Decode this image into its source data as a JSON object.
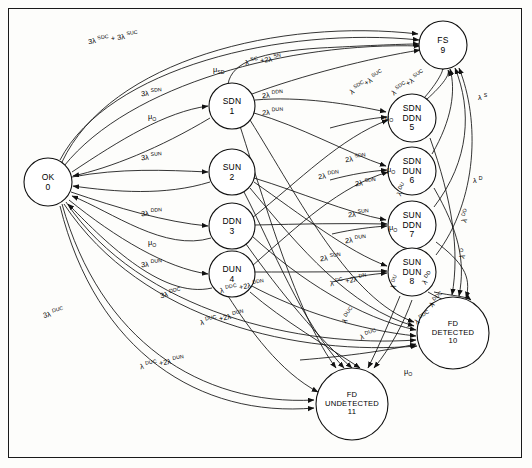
{
  "diagram": {
    "type": "markov-state-transition-diagram",
    "title": "",
    "border": {
      "color": "#1a1a1a"
    },
    "nodes": [
      {
        "id": "0",
        "name": "OK",
        "lines": [
          "OK",
          "0"
        ],
        "cx": 48,
        "cy": 182,
        "r": 24
      },
      {
        "id": "1",
        "name": "SDN",
        "lines": [
          "SDN",
          "1"
        ],
        "cx": 232,
        "cy": 106,
        "r": 23
      },
      {
        "id": "2",
        "name": "SUN",
        "lines": [
          "SUN",
          "2"
        ],
        "cx": 232,
        "cy": 172,
        "r": 23
      },
      {
        "id": "3",
        "name": "DDN",
        "lines": [
          "DDN",
          "3"
        ],
        "cx": 232,
        "cy": 226,
        "r": 23
      },
      {
        "id": "4",
        "name": "DUN",
        "lines": [
          "DUN",
          "4"
        ],
        "cx": 232,
        "cy": 274,
        "r": 23
      },
      {
        "id": "5",
        "name": "SDN DDN",
        "lines": [
          "SDN",
          "DDN",
          "5"
        ],
        "cx": 412,
        "cy": 118,
        "r": 24
      },
      {
        "id": "6",
        "name": "SDN DUN",
        "lines": [
          "SDN",
          "DUN",
          "6"
        ],
        "cx": 412,
        "cy": 171,
        "r": 24
      },
      {
        "id": "7",
        "name": "SUN DDN",
        "lines": [
          "SUN",
          "DDN",
          "7"
        ],
        "cx": 412,
        "cy": 225,
        "r": 24
      },
      {
        "id": "8",
        "name": "SUN DUN",
        "lines": [
          "SUN",
          "DUN",
          "8"
        ],
        "cx": 412,
        "cy": 272,
        "r": 24
      },
      {
        "id": "9",
        "name": "FS",
        "lines": [
          "FS",
          "9"
        ],
        "cx": 443,
        "cy": 45,
        "r": 24
      },
      {
        "id": "10",
        "name": "FD DETECTED",
        "lines": [
          "FD",
          "DETECTED",
          "10"
        ],
        "cx": 453,
        "cy": 333,
        "r": 36
      },
      {
        "id": "11",
        "name": "FD UNDETECTED",
        "lines": [
          "FD",
          "UNDETECTED",
          "11"
        ],
        "cx": 352,
        "cy": 404,
        "r": 36
      }
    ],
    "edge_labels": [
      {
        "id": "l1",
        "text": "3λ <sup>SDC</sup> + 3λ <sup>SUC</sup>",
        "plain": "3λSDC + 3λSUC",
        "x": 88,
        "y": 41,
        "rot": -8
      },
      {
        "id": "l2",
        "text": "μ<sub>SD</sub>",
        "plain": "μSD",
        "x": 213,
        "y": 70,
        "rot": 0
      },
      {
        "id": "l3",
        "text": "λ <sup>SC</sup> +2λ <sup>SN</sup>",
        "plain": "λSC + 2λSN",
        "x": 245,
        "y": 62,
        "rot": -8
      },
      {
        "id": "l4",
        "text": "3λ <sup>SDN</sup>",
        "plain": "3λSDN",
        "x": 141,
        "y": 93,
        "rot": -4
      },
      {
        "id": "l5",
        "text": "μ<sub>O</sub>",
        "plain": "μO",
        "x": 148,
        "y": 117,
        "rot": 0
      },
      {
        "id": "l6",
        "text": "2λ <sup>DDN</sup>",
        "plain": "2λDDN",
        "x": 262,
        "y": 95,
        "rot": -5
      },
      {
        "id": "l7",
        "text": "2λ <sup>DUN</sup>",
        "plain": "2λDUN",
        "x": 262,
        "y": 112,
        "rot": -3
      },
      {
        "id": "l8",
        "text": "λ <sup>SDC</sup>+λ <sup>SUC</sup>",
        "plain": "λSDC+λSUC",
        "x": 350,
        "y": 92,
        "rot": -32
      },
      {
        "id": "l9",
        "text": "λ <sup>SDC</sup>+λ <sup>SUC</sup>",
        "plain": "λSDC+λSUC",
        "x": 392,
        "y": 93,
        "rot": -34
      },
      {
        "id": "l10",
        "text": "λ <sup>S</sup>",
        "plain": "λS",
        "x": 478,
        "y": 97,
        "rot": 0
      },
      {
        "id": "l11",
        "text": "3λ <sup>SUN</sup>",
        "plain": "3λSUN",
        "x": 141,
        "y": 157,
        "rot": -4
      },
      {
        "id": "l12",
        "text": "μ<sub>O</sub>",
        "plain": "μO",
        "x": 385,
        "y": 118,
        "rot": 0
      },
      {
        "id": "l13",
        "text": "2λ <sup>SDN</sup>",
        "plain": "2λSDN",
        "x": 345,
        "y": 159,
        "rot": -7
      },
      {
        "id": "l14",
        "text": "2λ <sup>DDN</sup>",
        "plain": "2λDDN",
        "x": 318,
        "y": 176,
        "rot": -7
      },
      {
        "id": "l15",
        "text": "2λ <sup>SDN</sup>",
        "plain": "2λSDN",
        "x": 355,
        "y": 183,
        "rot": -5
      },
      {
        "id": "l16",
        "text": "μ<sub>O</sub>",
        "plain": "μO",
        "x": 387,
        "y": 170,
        "rot": 0
      },
      {
        "id": "l17",
        "text": "λ <sup>D</sup>",
        "plain": "λD",
        "x": 473,
        "y": 180,
        "rot": 0
      },
      {
        "id": "l18",
        "text": "λ <sup>DU</sup>",
        "plain": "λDU",
        "x": 398,
        "y": 195,
        "rot": -60
      },
      {
        "id": "l19",
        "text": "3λ <sup>DDN</sup>",
        "plain": "3λDDN",
        "x": 141,
        "y": 213,
        "rot": -4
      },
      {
        "id": "l20",
        "text": "2λ <sup>SUN</sup>",
        "plain": "2λSUN",
        "x": 348,
        "y": 214,
        "rot": -4
      },
      {
        "id": "l21",
        "text": "μ<sub>O</sub>",
        "plain": "μO",
        "x": 389,
        "y": 228,
        "rot": 0
      },
      {
        "id": "l22",
        "text": "λ <sup>DD</sup>",
        "plain": "λDD",
        "x": 463,
        "y": 222,
        "rot": -72
      },
      {
        "id": "l23",
        "text": "μ<sub>O</sub>",
        "plain": "μO",
        "x": 148,
        "y": 243,
        "rot": 0
      },
      {
        "id": "l24",
        "text": "2λ <sup>DUN</sup>",
        "plain": "2λDUN",
        "x": 345,
        "y": 240,
        "rot": -5
      },
      {
        "id": "l25",
        "text": "2λ <sup>SUN</sup>",
        "plain": "2λSUN",
        "x": 320,
        "y": 258,
        "rot": -5
      },
      {
        "id": "l26",
        "text": "λ <sup>D</sup>",
        "plain": "λD",
        "x": 461,
        "y": 258,
        "rot": -72
      },
      {
        "id": "l27",
        "text": "3λ <sup>DUN</sup>",
        "plain": "3λDUN",
        "x": 141,
        "y": 264,
        "rot": -4
      },
      {
        "id": "l28",
        "text": "3λ <sup>DDC</sup>",
        "plain": "3λDDC",
        "x": 160,
        "y": 295,
        "rot": -12
      },
      {
        "id": "l29",
        "text": "λ <sup>DDC</sup> +2λ <sup>DDN</sup>",
        "plain": "λDDC + 2λDDN",
        "x": 220,
        "y": 290,
        "rot": -10
      },
      {
        "id": "l30",
        "text": "λ <sup>DC</sup> +2λ <sup>DN</sup>",
        "plain": "λDC + 2λDN",
        "x": 330,
        "y": 283,
        "rot": -10
      },
      {
        "id": "l31",
        "text": "λ <sup>DU</sup>",
        "plain": "λDU",
        "x": 392,
        "y": 288,
        "rot": -68
      },
      {
        "id": "l32",
        "text": "λ <sup>DD</sup>",
        "plain": "λDD",
        "x": 423,
        "y": 283,
        "rot": -52
      },
      {
        "id": "l33",
        "text": "λ <sup>DDC</sup>",
        "plain": "λDDC",
        "x": 430,
        "y": 305,
        "rot": -42
      },
      {
        "id": "l34",
        "text": "λ <sup>DDC</sup>",
        "plain": "λDDC",
        "x": 415,
        "y": 322,
        "rot": -32
      },
      {
        "id": "l35",
        "text": "3λ <sup>DUC</sup>",
        "plain": "3λDUC",
        "x": 43,
        "y": 315,
        "rot": -14
      },
      {
        "id": "l36",
        "text": "λ <sup>DUC</sup> +2λ <sup>DUN</sup>",
        "plain": "λDUC + 2λDUN",
        "x": 200,
        "y": 322,
        "rot": -12
      },
      {
        "id": "l37",
        "text": "λ <sup>DUC</sup>",
        "plain": "λDUC",
        "x": 343,
        "y": 322,
        "rot": -55
      },
      {
        "id": "l38",
        "text": "λ <sup>DUC</sup>",
        "plain": "λDUC",
        "x": 360,
        "y": 337,
        "rot": -18
      },
      {
        "id": "l39",
        "text": "μ<sub>O</sub>",
        "plain": "μO",
        "x": 404,
        "y": 372,
        "rot": 0
      },
      {
        "id": "l40",
        "text": "λ <sup>DUC</sup> +2λ <sup>DUN</sup>",
        "plain": "λDUC + 2λDUN",
        "x": 140,
        "y": 366,
        "rot": -10
      }
    ]
  }
}
